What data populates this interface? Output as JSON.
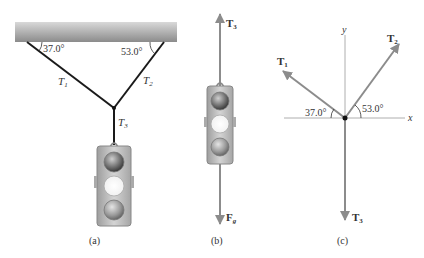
{
  "panels": {
    "a": {
      "caption": "(a)",
      "angle_left": "37.0°",
      "angle_right": "53.0°",
      "rope_labels": {
        "t1": "T",
        "t1_sub": "1",
        "t2": "T",
        "t2_sub": "2",
        "t3": "T",
        "t3_sub": "3"
      }
    },
    "b": {
      "caption": "(b)",
      "up_force": "T",
      "up_force_sub": "3",
      "down_force": "F",
      "down_force_sub": "g"
    },
    "c": {
      "caption": "(c)",
      "axis_x": "x",
      "axis_y": "y",
      "angle_left": "37.0°",
      "angle_right": "53.0°",
      "vec_t1": "T",
      "vec_t1_sub": "1",
      "vec_t2": "T",
      "vec_t2_sub": "2",
      "vec_t3": "T",
      "vec_t3_sub": "3"
    }
  },
  "colors": {
    "vector": "#8c8c8c",
    "rope": "#1a1a1a",
    "axis": "#9a9a9a",
    "ceiling_dark": "#8a8a8a",
    "ceiling_light": "#d8d8d8"
  }
}
